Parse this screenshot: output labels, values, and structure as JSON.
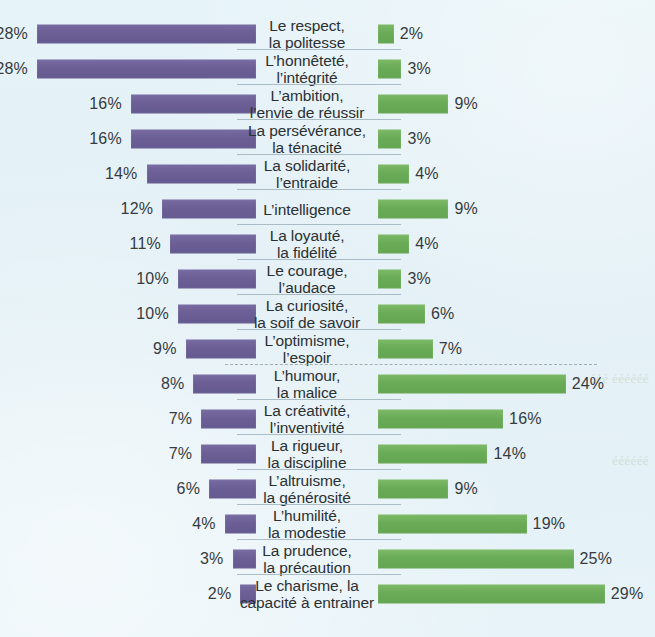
{
  "chart_data": {
    "type": "bar",
    "orientation": "horizontal",
    "layout": "diverging-pyramid",
    "title": "",
    "subtitle": "",
    "xlabel": "",
    "ylabel": "",
    "grid": false,
    "legend_position": "none",
    "value_suffix": "%",
    "axis_max": 30,
    "categories": [
      "Le respect, la politesse",
      "L’honnêteté, l’intégrité",
      "L’ambition, l’envie de réussir",
      "La persévérance, la ténacité",
      "La solidarité, l’entraide",
      "L’intelligence",
      "La loyauté, la fidélité",
      "Le courage, l’audace",
      "La curiosité, la soif de savoir",
      "L’optimisme, l’espoir",
      "L’humour, la malice",
      "La créativité, l’inventivité",
      "La rigueur, la discipline",
      "L’altruisme, la générosité",
      "L’humilité, la modestie",
      "La prudence, la précaution",
      "Le charisme, la capacité à entrainer"
    ],
    "series": [
      {
        "name": "left",
        "color": "#6b5f96",
        "side": "left",
        "values": [
          28,
          28,
          16,
          16,
          14,
          12,
          11,
          10,
          10,
          9,
          8,
          7,
          7,
          6,
          4,
          3,
          2
        ]
      },
      {
        "name": "right",
        "color": "#6aab57",
        "side": "right",
        "values": [
          2,
          3,
          9,
          3,
          4,
          9,
          4,
          3,
          6,
          7,
          24,
          16,
          14,
          9,
          19,
          25,
          29
        ]
      }
    ],
    "divider_after_category_index": 9
  },
  "rows": [
    {
      "label_line1": "Le respect,",
      "label_line2": "la politesse",
      "left_value": "28%",
      "right_value": "2%",
      "left_pct": 28,
      "right_pct": 2
    },
    {
      "label_line1": "L’honnêteté,",
      "label_line2": "l’intégrité",
      "left_value": "28%",
      "right_value": "3%",
      "left_pct": 28,
      "right_pct": 3
    },
    {
      "label_line1": "L’ambition,",
      "label_line2": "l’envie de réussir",
      "left_value": "16%",
      "right_value": "9%",
      "left_pct": 16,
      "right_pct": 9
    },
    {
      "label_line1": "La persévérance,",
      "label_line2": "la ténacité",
      "left_value": "16%",
      "right_value": "3%",
      "left_pct": 16,
      "right_pct": 3
    },
    {
      "label_line1": "La solidarité,",
      "label_line2": "l’entraide",
      "left_value": "14%",
      "right_value": "4%",
      "left_pct": 14,
      "right_pct": 4
    },
    {
      "label_line1": "L’intelligence",
      "label_line2": "",
      "left_value": "12%",
      "right_value": "9%",
      "left_pct": 12,
      "right_pct": 9
    },
    {
      "label_line1": "La loyauté,",
      "label_line2": "la fidélité",
      "left_value": "11%",
      "right_value": "4%",
      "left_pct": 11,
      "right_pct": 4
    },
    {
      "label_line1": "Le courage,",
      "label_line2": "l’audace",
      "left_value": "10%",
      "right_value": "3%",
      "left_pct": 10,
      "right_pct": 3
    },
    {
      "label_line1": "La curiosité,",
      "label_line2": "la soif de savoir",
      "left_value": "10%",
      "right_value": "6%",
      "left_pct": 10,
      "right_pct": 6
    },
    {
      "label_line1": "L’optimisme,",
      "label_line2": "l’espoir",
      "left_value": "9%",
      "right_value": "7%",
      "left_pct": 9,
      "right_pct": 7
    },
    {
      "label_line1": "L’humour,",
      "label_line2": "la malice",
      "left_value": "8%",
      "right_value": "24%",
      "left_pct": 8,
      "right_pct": 24
    },
    {
      "label_line1": "La créativité,",
      "label_line2": "l’inventivité",
      "left_value": "7%",
      "right_value": "16%",
      "left_pct": 7,
      "right_pct": 16
    },
    {
      "label_line1": "La rigueur,",
      "label_line2": "la discipline",
      "left_value": "7%",
      "right_value": "14%",
      "left_pct": 7,
      "right_pct": 14
    },
    {
      "label_line1": "L’altruisme,",
      "label_line2": "la générosité",
      "left_value": "6%",
      "right_value": "9%",
      "left_pct": 6,
      "right_pct": 9
    },
    {
      "label_line1": "L’humilité,",
      "label_line2": "la modestie",
      "left_value": "4%",
      "right_value": "19%",
      "left_pct": 4,
      "right_pct": 19
    },
    {
      "label_line1": "La prudence,",
      "label_line2": "la précaution",
      "left_value": "3%",
      "right_value": "25%",
      "left_pct": 3,
      "right_pct": 25
    },
    {
      "label_line1": "Le charisme, la",
      "label_line2": "capacité à entrainer",
      "left_value": "2%",
      "right_value": "29%",
      "left_pct": 2,
      "right_pct": 29
    }
  ],
  "bleed_through": {
    "line_a": "ééé éééééé",
    "line_b": "éééééé"
  },
  "colors": {
    "background": "#e3f1f7",
    "left_bar": "#6b5f96",
    "right_bar": "#6aab57",
    "separator": "#9fb3bd",
    "text": "#2d3134"
  }
}
